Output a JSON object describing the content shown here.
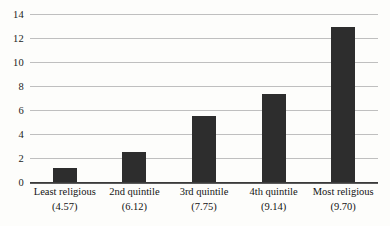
{
  "chart_data": {
    "type": "bar",
    "title": "",
    "subtitle": "",
    "xlabel": "",
    "ylabel": "",
    "categories": [
      "Least religious",
      "2nd quintile",
      "3rd quintile",
      "4th quintile",
      "Most religious"
    ],
    "category_values": [
      "(4.57)",
      "(6.12)",
      "(7.75)",
      "(9.14)",
      "(9.70)"
    ],
    "values": [
      1.2,
      2.5,
      5.5,
      7.3,
      12.9
    ],
    "ylim": [
      0,
      14
    ],
    "yticks": [
      0,
      2,
      4,
      6,
      8,
      10,
      12,
      14
    ],
    "ytick_labels": [
      "0",
      "2",
      "4",
      "6",
      "8",
      "10",
      "12",
      "14"
    ],
    "grid": true,
    "legend": false,
    "legend_position": "none",
    "bar_color": "#2d2d2d",
    "gridline_color": "#9a9a9a",
    "axis_color": "#3a3a3a",
    "background_color": "#fdfdfb"
  }
}
